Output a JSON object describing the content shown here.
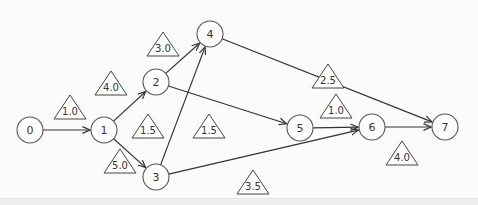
{
  "diagram": {
    "type": "activity-network",
    "nodes": [
      {
        "id": "0",
        "label": "0",
        "x": 30,
        "y": 130
      },
      {
        "id": "1",
        "label": "1",
        "x": 104,
        "y": 130
      },
      {
        "id": "2",
        "label": "2",
        "x": 156,
        "y": 82
      },
      {
        "id": "3",
        "label": "3",
        "x": 156,
        "y": 177
      },
      {
        "id": "4",
        "label": "4",
        "x": 210,
        "y": 34
      },
      {
        "id": "5",
        "label": "5",
        "x": 300,
        "y": 128
      },
      {
        "id": "6",
        "label": "6",
        "x": 372,
        "y": 127
      },
      {
        "id": "7",
        "label": "7",
        "x": 445,
        "y": 127
      }
    ],
    "edges": [
      {
        "from": "0",
        "to": "1"
      },
      {
        "from": "1",
        "to": "2"
      },
      {
        "from": "1",
        "to": "3"
      },
      {
        "from": "2",
        "to": "4"
      },
      {
        "from": "2",
        "to": "5"
      },
      {
        "from": "3",
        "to": "4"
      },
      {
        "from": "3",
        "to": "6"
      },
      {
        "from": "4",
        "to": "7"
      },
      {
        "from": "5",
        "to": "6"
      },
      {
        "from": "6",
        "to": "7"
      }
    ],
    "weights": [
      {
        "label": "1.0",
        "x": 70,
        "y": 107
      },
      {
        "label": "4.0",
        "x": 111,
        "y": 83
      },
      {
        "label": "3.0",
        "x": 163,
        "y": 44
      },
      {
        "label": "1.5",
        "x": 148,
        "y": 126
      },
      {
        "label": "1.5",
        "x": 209,
        "y": 126
      },
      {
        "label": "5.0",
        "x": 120,
        "y": 161
      },
      {
        "label": "2.5",
        "x": 328,
        "y": 76
      },
      {
        "label": "1.0",
        "x": 336,
        "y": 106
      },
      {
        "label": "4.0",
        "x": 402,
        "y": 153
      },
      {
        "label": "3.5",
        "x": 253,
        "y": 182
      }
    ]
  }
}
